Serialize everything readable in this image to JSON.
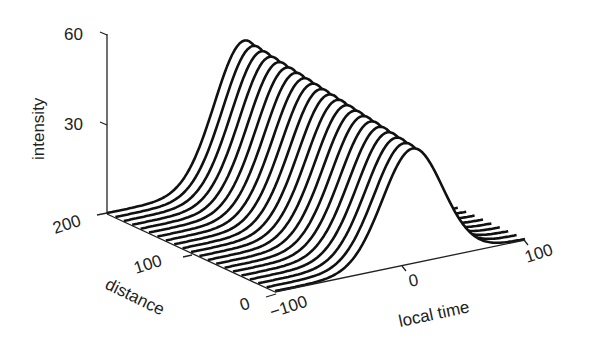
{
  "chart_data": {
    "type": "line",
    "subtype": "3d-waterfall",
    "title": "",
    "xlabel": "local time",
    "ylabel": "distance",
    "zlabel": "intensity",
    "xlim": [
      -100,
      100
    ],
    "ylim": [
      0,
      200
    ],
    "zlim": [
      0,
      60
    ],
    "x_ticks": [
      "-100",
      "0",
      "100"
    ],
    "y_ticks": [
      "0",
      "100",
      "200"
    ],
    "z_ticks": [
      "30",
      "60"
    ],
    "grid": false,
    "legend": null,
    "series_count": 21,
    "distance_values": [
      0,
      10,
      20,
      30,
      40,
      50,
      60,
      70,
      80,
      90,
      100,
      110,
      120,
      130,
      140,
      150,
      160,
      170,
      180,
      190,
      200
    ],
    "pulse_shape": "gaussian",
    "pulse_center_local_time": 10,
    "pulse_width_local_time": 38,
    "peak_intensity_by_distance": [
      38,
      38.5,
      39,
      39.5,
      40,
      40.5,
      41,
      41.5,
      42,
      42.5,
      43,
      43.5,
      44,
      44.5,
      45,
      45.5,
      46,
      46.5,
      47,
      47.5,
      48
    ],
    "line_color": "#111111"
  },
  "labels": {
    "z_axis": "intensity",
    "y_axis": "distance",
    "x_axis": "local time",
    "z_tick_60": "60",
    "z_tick_30": "30",
    "y_tick_200": "200",
    "y_tick_100": "100",
    "y_tick_0": "0",
    "x_tick_m100": "−100",
    "x_tick_0": "0",
    "x_tick_100": "100"
  }
}
